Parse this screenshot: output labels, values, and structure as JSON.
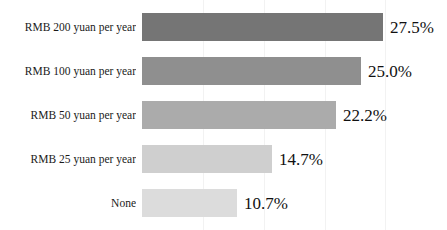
{
  "chart_data": {
    "type": "bar",
    "orientation": "horizontal",
    "title": "",
    "subtitle": "",
    "xlabel": "",
    "ylabel": "",
    "xlim": [
      0,
      32.3
    ],
    "grid": "vertical-faint",
    "legend": "none",
    "value_suffix": "%",
    "categories": [
      "RMB 200 yuan per year",
      "RMB 100 yuan per year",
      "RMB 50 yuan per year",
      "RMB 25 yuan per year",
      "None"
    ],
    "values": [
      27.5,
      25.0,
      22.2,
      14.7,
      10.7
    ],
    "value_labels": [
      "27.5%",
      "25.0%",
      "22.2%",
      "14.7%",
      "10.7%"
    ],
    "bar_colors": [
      "#757575",
      "#8f8f8f",
      "#ababab",
      "#cfcfcf",
      "#dcdcdc"
    ],
    "bar_tops": [
      13,
      57,
      101,
      145,
      189
    ],
    "bar_widths": [
      241,
      219,
      194,
      130,
      95
    ],
    "gridline_positions": [
      203,
      264,
      325,
      385
    ]
  }
}
